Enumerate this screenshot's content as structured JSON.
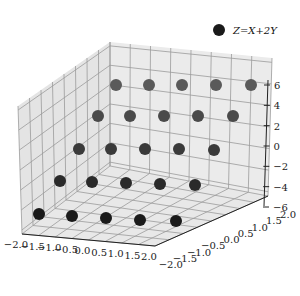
{
  "chart_data": {
    "type": "scatter3d",
    "title": "",
    "xlabel": "",
    "ylabel": "",
    "zlabel": "",
    "legend": {
      "entries": [
        "Z=X+2Y"
      ],
      "position": "upper right"
    },
    "grid": true,
    "xlim": [
      -2.0,
      2.0
    ],
    "ylim": [
      -2.0,
      2.0
    ],
    "zlim": [
      -6,
      6
    ],
    "x_ticks": [
      "−2.0",
      "−1.5",
      "−1.0",
      "−0.5",
      "0.0",
      "0.5",
      "1.0",
      "1.5",
      "2.0"
    ],
    "y_ticks": [
      "−2.0",
      "−1.5",
      "−1.0",
      "−0.5",
      "0.0",
      "0.5",
      "1.0",
      "1.5",
      "2.0"
    ],
    "z_ticks": [
      "−6",
      "−4",
      "−2",
      "0",
      "2",
      "4",
      "6"
    ],
    "series": [
      {
        "name": "Z=X+2Y",
        "color": "#1a1a1a",
        "points": [
          {
            "x": -2,
            "y": -2,
            "z": -6
          },
          {
            "x": -1,
            "y": -2,
            "z": -5
          },
          {
            "x": 0,
            "y": -2,
            "z": -4
          },
          {
            "x": 1,
            "y": -2,
            "z": -3
          },
          {
            "x": 2,
            "y": -2,
            "z": -2
          },
          {
            "x": -2,
            "y": -1,
            "z": -4
          },
          {
            "x": -1,
            "y": -1,
            "z": -3
          },
          {
            "x": 0,
            "y": -1,
            "z": -2
          },
          {
            "x": 1,
            "y": -1,
            "z": -1
          },
          {
            "x": 2,
            "y": -1,
            "z": 0
          },
          {
            "x": -2,
            "y": 0,
            "z": -2
          },
          {
            "x": -1,
            "y": 0,
            "z": -1
          },
          {
            "x": 0,
            "y": 0,
            "z": 0
          },
          {
            "x": 1,
            "y": 0,
            "z": 1
          },
          {
            "x": 2,
            "y": 0,
            "z": 2
          },
          {
            "x": -2,
            "y": 1,
            "z": 0
          },
          {
            "x": -1,
            "y": 1,
            "z": 1
          },
          {
            "x": 0,
            "y": 1,
            "z": 2
          },
          {
            "x": 1,
            "y": 1,
            "z": 3
          },
          {
            "x": 2,
            "y": 1,
            "z": 4
          },
          {
            "x": -2,
            "y": 2,
            "z": 2
          },
          {
            "x": -1,
            "y": 2,
            "z": 3
          },
          {
            "x": 0,
            "y": 2,
            "z": 4
          },
          {
            "x": 1,
            "y": 2,
            "z": 5
          },
          {
            "x": 2,
            "y": 2,
            "z": 6
          }
        ]
      }
    ]
  },
  "screen_points": [
    [
      [
        39,
        214
      ],
      [
        72,
        216
      ],
      [
        106,
        218
      ],
      [
        140,
        220
      ],
      [
        176,
        221
      ]
    ],
    [
      [
        60,
        181
      ],
      [
        92,
        182
      ],
      [
        126,
        183
      ],
      [
        160,
        184
      ],
      [
        195,
        185
      ]
    ],
    [
      [
        79,
        149
      ],
      [
        111,
        149
      ],
      [
        145,
        149
      ],
      [
        179,
        149
      ],
      [
        214,
        150
      ]
    ],
    [
      [
        98,
        116
      ],
      [
        130,
        116
      ],
      [
        164,
        116
      ],
      [
        198,
        116
      ],
      [
        233,
        116
      ]
    ],
    [
      [
        116,
        85
      ],
      [
        149,
        85
      ],
      [
        182,
        85
      ],
      [
        216,
        85
      ],
      [
        251,
        85
      ]
    ]
  ],
  "colors": {
    "pane": "#ebebeb",
    "pane_left": "#e4e4e4",
    "pane_floor": "#e8e8e8",
    "grid": "#9a9a9a",
    "axis": "#222222",
    "marker": "#1a1a1a"
  }
}
